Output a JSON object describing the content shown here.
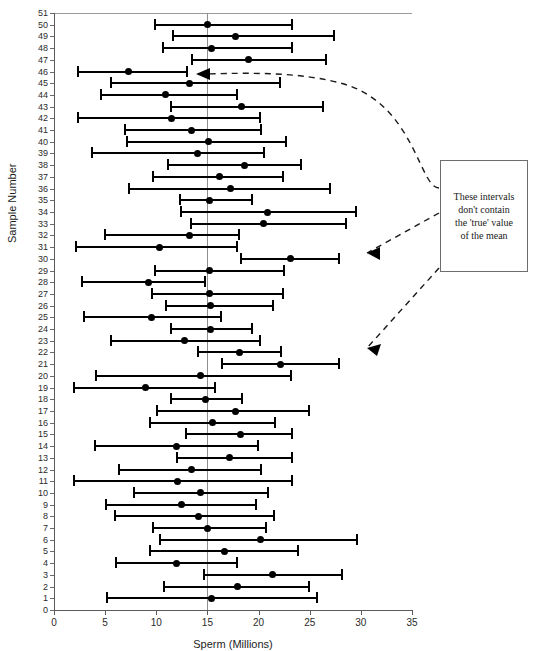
{
  "figure": {
    "x_axis_title": "Sperm (Millions)",
    "y_axis_title": "Sample Number",
    "annotation_text": "These intervals\ndon't contain\nthe 'true' value\nof the mean",
    "colors": {
      "interval": "#000000",
      "axis": "#5a5a5a",
      "reference_line": "#8e8e8e",
      "annotation_border": "#6d6d6d"
    }
  },
  "chart_data": {
    "type": "scatter",
    "title": "",
    "subtitle": "",
    "xlabel": "Sperm (Millions)",
    "ylabel": "Sample Number",
    "xlim": [
      0,
      35
    ],
    "ylim": [
      0,
      51
    ],
    "grid": false,
    "legend": "none",
    "xticks": [
      0,
      5,
      10,
      15,
      20,
      25,
      30,
      35
    ],
    "yticks": [
      0,
      1,
      2,
      3,
      4,
      5,
      6,
      7,
      8,
      9,
      10,
      11,
      12,
      13,
      14,
      15,
      16,
      17,
      18,
      19,
      20,
      21,
      22,
      23,
      24,
      25,
      26,
      27,
      28,
      29,
      30,
      31,
      32,
      33,
      34,
      35,
      36,
      37,
      38,
      39,
      40,
      41,
      42,
      43,
      44,
      45,
      46,
      47,
      48,
      49,
      50,
      51
    ],
    "reference_line": {
      "orientation": "vertical",
      "value": 15,
      "label": "true mean"
    },
    "annotations": [
      {
        "text": "These intervals don't contain the 'true' value of the mean",
        "points_to_samples": [
          46,
          30,
          21
        ]
      }
    ],
    "series_name": "95% confidence interval of the mean",
    "point_field": "mean",
    "interval_fields": [
      "lower",
      "upper"
    ],
    "points": [
      {
        "sample": 50,
        "lower": 9.8,
        "mean": 15.0,
        "upper": 23.4,
        "contains_true": true
      },
      {
        "sample": 49,
        "lower": 11.5,
        "mean": 17.7,
        "upper": 27.5,
        "contains_true": true
      },
      {
        "sample": 48,
        "lower": 10.6,
        "mean": 15.4,
        "upper": 23.4,
        "contains_true": true
      },
      {
        "sample": 47,
        "lower": 13.4,
        "mean": 19.0,
        "upper": 26.7,
        "contains_true": true
      },
      {
        "sample": 46,
        "lower": 2.2,
        "mean": 7.3,
        "upper": 13.1,
        "contains_true": false
      },
      {
        "sample": 45,
        "lower": 5.5,
        "mean": 13.2,
        "upper": 22.2,
        "contains_true": true
      },
      {
        "sample": 44,
        "lower": 4.5,
        "mean": 10.9,
        "upper": 18.0,
        "contains_true": true
      },
      {
        "sample": 43,
        "lower": 11.3,
        "mean": 18.3,
        "upper": 26.4,
        "contains_true": true
      },
      {
        "sample": 42,
        "lower": 2.2,
        "mean": 11.5,
        "upper": 20.2,
        "contains_true": true
      },
      {
        "sample": 41,
        "lower": 6.8,
        "mean": 13.4,
        "upper": 20.3,
        "contains_true": true
      },
      {
        "sample": 40,
        "lower": 7.0,
        "mean": 15.1,
        "upper": 22.8,
        "contains_true": true
      },
      {
        "sample": 39,
        "lower": 3.6,
        "mean": 14.0,
        "upper": 20.6,
        "contains_true": true
      },
      {
        "sample": 38,
        "lower": 11.0,
        "mean": 18.6,
        "upper": 24.2,
        "contains_true": true
      },
      {
        "sample": 37,
        "lower": 9.6,
        "mean": 16.2,
        "upper": 22.5,
        "contains_true": true
      },
      {
        "sample": 36,
        "lower": 7.2,
        "mean": 17.3,
        "upper": 27.1,
        "contains_true": true
      },
      {
        "sample": 35,
        "lower": 12.2,
        "mean": 15.2,
        "upper": 19.5,
        "contains_true": true
      },
      {
        "sample": 34,
        "lower": 12.3,
        "mean": 20.9,
        "upper": 29.6,
        "contains_true": true
      },
      {
        "sample": 33,
        "lower": 13.3,
        "mean": 20.5,
        "upper": 28.6,
        "contains_true": true
      },
      {
        "sample": 32,
        "lower": 4.9,
        "mean": 13.2,
        "upper": 18.2,
        "contains_true": true
      },
      {
        "sample": 31,
        "lower": 2.1,
        "mean": 10.3,
        "upper": 18.0,
        "contains_true": true
      },
      {
        "sample": 30,
        "lower": 18.2,
        "mean": 23.1,
        "upper": 28.0,
        "contains_true": false
      },
      {
        "sample": 29,
        "lower": 9.8,
        "mean": 15.2,
        "upper": 22.6,
        "contains_true": true
      },
      {
        "sample": 28,
        "lower": 2.6,
        "mean": 9.2,
        "upper": 14.9,
        "contains_true": false
      },
      {
        "sample": 27,
        "lower": 9.5,
        "mean": 15.2,
        "upper": 22.5,
        "contains_true": true
      },
      {
        "sample": 26,
        "lower": 10.9,
        "mean": 15.3,
        "upper": 21.5,
        "contains_true": true
      },
      {
        "sample": 25,
        "lower": 2.8,
        "mean": 9.5,
        "upper": 16.4,
        "contains_true": true
      },
      {
        "sample": 24,
        "lower": 11.3,
        "mean": 15.3,
        "upper": 19.5,
        "contains_true": true
      },
      {
        "sample": 23,
        "lower": 5.5,
        "mean": 12.8,
        "upper": 20.2,
        "contains_true": true
      },
      {
        "sample": 22,
        "lower": 14.0,
        "mean": 18.1,
        "upper": 22.3,
        "contains_true": true
      },
      {
        "sample": 21,
        "lower": 16.3,
        "mean": 22.1,
        "upper": 28.0,
        "contains_true": false
      },
      {
        "sample": 20,
        "lower": 4.0,
        "mean": 14.3,
        "upper": 23.3,
        "contains_true": true
      },
      {
        "sample": 19,
        "lower": 1.9,
        "mean": 8.9,
        "upper": 15.8,
        "contains_true": true
      },
      {
        "sample": 18,
        "lower": 11.3,
        "mean": 14.8,
        "upper": 18.5,
        "contains_true": true
      },
      {
        "sample": 17,
        "lower": 10.0,
        "mean": 17.7,
        "upper": 25.0,
        "contains_true": true
      },
      {
        "sample": 16,
        "lower": 9.3,
        "mean": 15.5,
        "upper": 21.7,
        "contains_true": true
      },
      {
        "sample": 15,
        "lower": 12.8,
        "mean": 18.2,
        "upper": 23.4,
        "contains_true": true
      },
      {
        "sample": 14,
        "lower": 3.9,
        "mean": 12.0,
        "upper": 20.0,
        "contains_true": true
      },
      {
        "sample": 13,
        "lower": 11.9,
        "mean": 17.2,
        "upper": 23.4,
        "contains_true": true
      },
      {
        "sample": 12,
        "lower": 6.3,
        "mean": 13.4,
        "upper": 20.3,
        "contains_true": true
      },
      {
        "sample": 11,
        "lower": 1.9,
        "mean": 12.1,
        "upper": 23.4,
        "contains_true": true
      },
      {
        "sample": 10,
        "lower": 7.7,
        "mean": 14.3,
        "upper": 21.0,
        "contains_true": true
      },
      {
        "sample": 9,
        "lower": 5.0,
        "mean": 12.5,
        "upper": 19.8,
        "contains_true": true
      },
      {
        "sample": 8,
        "lower": 5.9,
        "mean": 14.1,
        "upper": 21.6,
        "contains_true": true
      },
      {
        "sample": 7,
        "lower": 9.6,
        "mean": 15.0,
        "upper": 20.8,
        "contains_true": true
      },
      {
        "sample": 6,
        "lower": 10.3,
        "mean": 20.2,
        "upper": 29.7,
        "contains_true": true
      },
      {
        "sample": 5,
        "lower": 9.3,
        "mean": 16.7,
        "upper": 24.0,
        "contains_true": true
      },
      {
        "sample": 4,
        "lower": 6.0,
        "mean": 12.0,
        "upper": 18.0,
        "contains_true": true
      },
      {
        "sample": 3,
        "lower": 14.6,
        "mean": 21.4,
        "upper": 28.3,
        "contains_true": true
      },
      {
        "sample": 2,
        "lower": 10.7,
        "mean": 17.9,
        "upper": 25.0,
        "contains_true": true
      },
      {
        "sample": 1,
        "lower": 5.1,
        "mean": 15.4,
        "upper": 25.8,
        "contains_true": true
      }
    ]
  }
}
